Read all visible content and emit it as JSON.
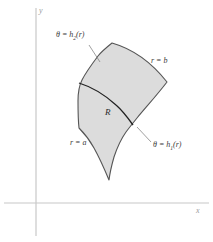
{
  "figure": {
    "background_color": "#ffffff",
    "region_fill_color": "#dcdcdc",
    "region_stroke_color": "#555555",
    "inner_curve_color": "#222222",
    "axis_color": "#c8c8c8",
    "leader_color": "#777777"
  },
  "axes": {
    "y_label": "y",
    "x_label": "x",
    "origin_x": 36,
    "origin_y": 203
  },
  "labels": {
    "theta_upper": {
      "lhs": "θ = h",
      "sub": "2",
      "rhs": "(r)"
    },
    "theta_lower": {
      "lhs": "θ = h",
      "sub": "1",
      "rhs": "(r)"
    },
    "r_outer": "r = b",
    "r_inner": "r = a",
    "region": "R"
  }
}
